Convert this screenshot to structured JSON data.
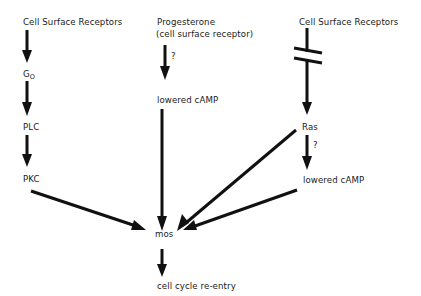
{
  "diagram": {
    "type": "signaling-pathway",
    "nodes": {
      "csr_left": "Cell Surface Receptors",
      "progesterone_line1": "Progesterone",
      "progesterone_line2": "(cell surface receptor)",
      "csr_right": "Cell Surface Receptors",
      "go_main": "G",
      "go_sub": "O",
      "plc": "PLC",
      "pkc": "PKC",
      "lowered_camp_mid": "lowered cAMP",
      "ras": "Ras",
      "lowered_camp_right": "lowered cAMP",
      "mos": "mos",
      "cell_cycle": "cell cycle re-entry"
    },
    "annotations": {
      "q_progesterone": "?",
      "q_ras": "?"
    },
    "edges": [
      {
        "from": "Cell Surface Receptors (left)",
        "to": "Go"
      },
      {
        "from": "Go",
        "to": "PLC"
      },
      {
        "from": "PLC",
        "to": "PKC"
      },
      {
        "from": "PKC",
        "to": "mos"
      },
      {
        "from": "Progesterone",
        "to": "lowered cAMP (middle)",
        "label": "?"
      },
      {
        "from": "lowered cAMP (middle)",
        "to": "mos"
      },
      {
        "from": "Cell Surface Receptors (right)",
        "to": "Ras",
        "style": "broken"
      },
      {
        "from": "Ras",
        "to": "mos"
      },
      {
        "from": "Ras",
        "to": "lowered cAMP (right)",
        "label": "?"
      },
      {
        "from": "lowered cAMP (right)",
        "to": "mos"
      },
      {
        "from": "mos",
        "to": "cell cycle re-entry"
      }
    ],
    "colors": {
      "line": "#111111",
      "text": "#1a1a1a",
      "background": "#ffffff"
    }
  }
}
